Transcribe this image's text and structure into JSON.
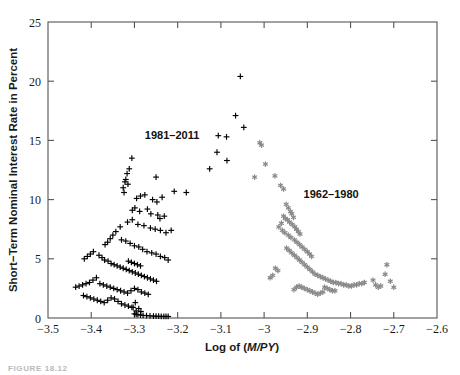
{
  "figure": {
    "caption": "FIGURE 18.12"
  },
  "chart_data": {
    "type": "scatter",
    "title": "",
    "xlabel_prefix": "Log of (",
    "xlabel_italic": "M/PY",
    "xlabel_suffix": ")",
    "xlabel": "Log of (M/PY)",
    "ylabel": "Short−Term Nominal Interest Rate in Percent",
    "xlim": [
      -3.5,
      -2.6
    ],
    "ylim": [
      0,
      25
    ],
    "xticks": [
      -3.5,
      -3.4,
      -3.3,
      -3.2,
      -3.1,
      -3.0,
      -2.9,
      -2.8,
      -2.7,
      -2.6
    ],
    "xticklabels": [
      "−3.5",
      "−3.4",
      "−3.3",
      "−3.2",
      "−3.1",
      "−3",
      "−2.9",
      "−2.8",
      "−2.7",
      "−2.6"
    ],
    "yticks": [
      0,
      5,
      10,
      15,
      20,
      25
    ],
    "yticklabels": [
      "0",
      "5",
      "10",
      "15",
      "20",
      "25"
    ],
    "grid": false,
    "legend_position": "inline-annotations",
    "series": [
      {
        "name": "1981–2011",
        "marker": "plus",
        "color": "#000000",
        "annotation": {
          "text": "1981–2011",
          "x": -3.213,
          "y": 15.1
        },
        "points": [
          [
            -3.055,
            20.4
          ],
          [
            -3.066,
            17.1
          ],
          [
            -3.047,
            16.1
          ],
          [
            -3.106,
            15.4
          ],
          [
            -3.087,
            15.3
          ],
          [
            -3.109,
            14.0
          ],
          [
            -3.086,
            13.3
          ],
          [
            -3.126,
            12.6
          ],
          [
            -3.306,
            13.5
          ],
          [
            -3.312,
            12.6
          ],
          [
            -3.317,
            12.2
          ],
          [
            -3.32,
            11.7
          ],
          [
            -3.322,
            11.5
          ],
          [
            -3.315,
            11.3
          ],
          [
            -3.326,
            11.0
          ],
          [
            -3.324,
            10.6
          ],
          [
            -3.25,
            11.9
          ],
          [
            -3.208,
            10.7
          ],
          [
            -3.18,
            10.6
          ],
          [
            -3.276,
            10.4
          ],
          [
            -3.286,
            10.3
          ],
          [
            -3.295,
            10.1
          ],
          [
            -3.258,
            10.0
          ],
          [
            -3.248,
            9.8
          ],
          [
            -3.236,
            10.2
          ],
          [
            -3.299,
            9.3
          ],
          [
            -3.305,
            9.1
          ],
          [
            -3.288,
            9.0
          ],
          [
            -3.27,
            9.2
          ],
          [
            -3.262,
            8.8
          ],
          [
            -3.246,
            8.7
          ],
          [
            -3.241,
            8.4
          ],
          [
            -3.231,
            8.6
          ],
          [
            -3.305,
            8.3
          ],
          [
            -3.316,
            8.1
          ],
          [
            -3.292,
            7.9
          ],
          [
            -3.278,
            7.8
          ],
          [
            -3.263,
            7.6
          ],
          [
            -3.252,
            7.5
          ],
          [
            -3.24,
            7.4
          ],
          [
            -3.227,
            7.2
          ],
          [
            -3.215,
            7.4
          ],
          [
            -3.333,
            7.7
          ],
          [
            -3.343,
            7.3
          ],
          [
            -3.35,
            7.0
          ],
          [
            -3.356,
            6.7
          ],
          [
            -3.362,
            6.4
          ],
          [
            -3.368,
            6.2
          ],
          [
            -3.33,
            6.6
          ],
          [
            -3.32,
            6.5
          ],
          [
            -3.31,
            6.3
          ],
          [
            -3.3,
            6.1
          ],
          [
            -3.29,
            6.0
          ],
          [
            -3.281,
            5.8
          ],
          [
            -3.271,
            5.6
          ],
          [
            -3.26,
            5.5
          ],
          [
            -3.25,
            5.4
          ],
          [
            -3.24,
            5.2
          ],
          [
            -3.23,
            5.1
          ],
          [
            -3.222,
            4.9
          ],
          [
            -3.395,
            5.6
          ],
          [
            -3.402,
            5.4
          ],
          [
            -3.409,
            5.2
          ],
          [
            -3.416,
            5.0
          ],
          [
            -3.382,
            5.3
          ],
          [
            -3.375,
            5.1
          ],
          [
            -3.369,
            4.9
          ],
          [
            -3.361,
            4.8
          ],
          [
            -3.354,
            4.6
          ],
          [
            -3.347,
            4.5
          ],
          [
            -3.34,
            4.4
          ],
          [
            -3.333,
            4.3
          ],
          [
            -3.326,
            4.2
          ],
          [
            -3.319,
            4.1
          ],
          [
            -3.312,
            4.0
          ],
          [
            -3.305,
            3.9
          ],
          [
            -3.298,
            3.8
          ],
          [
            -3.291,
            3.7
          ],
          [
            -3.284,
            3.6
          ],
          [
            -3.277,
            3.5
          ],
          [
            -3.27,
            3.4
          ],
          [
            -3.263,
            3.3
          ],
          [
            -3.256,
            3.2
          ],
          [
            -3.249,
            3.1
          ],
          [
            -3.3,
            4.6
          ],
          [
            -3.293,
            4.5
          ],
          [
            -3.286,
            4.4
          ],
          [
            -3.307,
            4.7
          ],
          [
            -3.314,
            4.8
          ],
          [
            -3.388,
            3.4
          ],
          [
            -3.396,
            3.2
          ],
          [
            -3.404,
            3.0
          ],
          [
            -3.412,
            2.9
          ],
          [
            -3.42,
            2.8
          ],
          [
            -3.428,
            2.7
          ],
          [
            -3.436,
            2.6
          ],
          [
            -3.38,
            2.9
          ],
          [
            -3.372,
            2.8
          ],
          [
            -3.364,
            2.7
          ],
          [
            -3.356,
            2.6
          ],
          [
            -3.348,
            2.5
          ],
          [
            -3.34,
            2.4
          ],
          [
            -3.332,
            2.3
          ],
          [
            -3.324,
            2.2
          ],
          [
            -3.316,
            2.1
          ],
          [
            -3.308,
            2.3
          ],
          [
            -3.3,
            2.5
          ],
          [
            -3.292,
            2.4
          ],
          [
            -3.284,
            2.2
          ],
          [
            -3.276,
            2.1
          ],
          [
            -3.268,
            2.0
          ],
          [
            -3.418,
            1.9
          ],
          [
            -3.41,
            1.8
          ],
          [
            -3.402,
            1.7
          ],
          [
            -3.394,
            1.6
          ],
          [
            -3.386,
            1.5
          ],
          [
            -3.378,
            1.4
          ],
          [
            -3.37,
            1.3
          ],
          [
            -3.362,
            1.5
          ],
          [
            -3.354,
            1.7
          ],
          [
            -3.346,
            1.6
          ],
          [
            -3.338,
            1.4
          ],
          [
            -3.33,
            1.2
          ],
          [
            -3.322,
            1.1
          ],
          [
            -3.314,
            1.0
          ],
          [
            -3.306,
            0.9
          ],
          [
            -3.298,
            1.3
          ],
          [
            -3.29,
            0.8
          ],
          [
            -3.3,
            0.35
          ],
          [
            -3.296,
            0.3
          ],
          [
            -3.292,
            0.28
          ],
          [
            -3.286,
            0.25
          ],
          [
            -3.28,
            0.22
          ],
          [
            -3.272,
            0.2
          ],
          [
            -3.264,
            0.18
          ],
          [
            -3.256,
            0.16
          ],
          [
            -3.25,
            0.15
          ],
          [
            -3.244,
            0.15
          ],
          [
            -3.238,
            0.14
          ],
          [
            -3.232,
            0.14
          ],
          [
            -3.227,
            0.13
          ],
          [
            -3.222,
            0.13
          ],
          [
            -3.303,
            0.9
          ],
          [
            -3.296,
            0.6
          ],
          [
            -3.285,
            0.55
          ]
        ]
      },
      {
        "name": "1962–1980",
        "marker": "asterisk",
        "color": "#8a8a8a",
        "annotation": {
          "text": "1962–1980",
          "x": -2.845,
          "y": 10.1
        },
        "points": [
          [
            -3.01,
            14.8
          ],
          [
            -3.006,
            14.6
          ],
          [
            -2.997,
            13.0
          ],
          [
            -3.022,
            11.9
          ],
          [
            -2.975,
            12.0
          ],
          [
            -2.962,
            11.2
          ],
          [
            -2.955,
            10.9
          ],
          [
            -2.949,
            9.6
          ],
          [
            -2.944,
            9.3
          ],
          [
            -2.939,
            9.0
          ],
          [
            -2.936,
            8.8
          ],
          [
            -2.932,
            8.5
          ],
          [
            -2.946,
            8.3
          ],
          [
            -2.941,
            8.1
          ],
          [
            -2.935,
            7.9
          ],
          [
            -2.929,
            7.7
          ],
          [
            -2.925,
            7.5
          ],
          [
            -2.921,
            7.3
          ],
          [
            -2.917,
            7.1
          ],
          [
            -2.955,
            8.6
          ],
          [
            -2.951,
            8.4
          ],
          [
            -2.96,
            8.0
          ],
          [
            -2.966,
            7.7
          ],
          [
            -2.958,
            7.4
          ],
          [
            -2.952,
            7.2
          ],
          [
            -2.944,
            7.0
          ],
          [
            -2.938,
            6.8
          ],
          [
            -2.93,
            6.6
          ],
          [
            -2.924,
            6.4
          ],
          [
            -2.918,
            6.2
          ],
          [
            -2.912,
            6.0
          ],
          [
            -2.906,
            5.8
          ],
          [
            -2.9,
            5.6
          ],
          [
            -2.895,
            5.4
          ],
          [
            -2.89,
            5.2
          ],
          [
            -2.948,
            5.9
          ],
          [
            -2.942,
            5.7
          ],
          [
            -2.936,
            5.5
          ],
          [
            -2.93,
            5.3
          ],
          [
            -2.924,
            5.1
          ],
          [
            -2.918,
            4.9
          ],
          [
            -2.912,
            4.7
          ],
          [
            -2.906,
            4.5
          ],
          [
            -2.9,
            4.3
          ],
          [
            -2.894,
            4.1
          ],
          [
            -2.888,
            3.9
          ],
          [
            -2.882,
            3.7
          ],
          [
            -2.876,
            3.6
          ],
          [
            -2.87,
            3.5
          ],
          [
            -2.864,
            3.4
          ],
          [
            -2.858,
            3.3
          ],
          [
            -2.852,
            3.2
          ],
          [
            -2.846,
            3.1
          ],
          [
            -2.84,
            3.0
          ],
          [
            -2.834,
            3.0
          ],
          [
            -2.828,
            2.9
          ],
          [
            -2.822,
            2.9
          ],
          [
            -2.816,
            2.8
          ],
          [
            -2.81,
            2.8
          ],
          [
            -2.804,
            2.7
          ],
          [
            -2.798,
            2.7
          ],
          [
            -2.792,
            2.8
          ],
          [
            -2.786,
            2.8
          ],
          [
            -2.78,
            2.9
          ],
          [
            -2.774,
            2.9
          ],
          [
            -2.768,
            3.0
          ],
          [
            -2.9,
            2.4
          ],
          [
            -2.894,
            2.3
          ],
          [
            -2.888,
            2.2
          ],
          [
            -2.882,
            2.1
          ],
          [
            -2.876,
            2.0
          ],
          [
            -2.87,
            2.1
          ],
          [
            -2.864,
            2.2
          ],
          [
            -2.913,
            2.6
          ],
          [
            -2.907,
            2.5
          ],
          [
            -2.919,
            2.7
          ],
          [
            -2.925,
            2.6
          ],
          [
            -2.931,
            2.4
          ],
          [
            -2.86,
            2.6
          ],
          [
            -2.854,
            2.5
          ],
          [
            -2.848,
            2.4
          ],
          [
            -2.842,
            2.3
          ],
          [
            -2.836,
            2.3
          ],
          [
            -2.72,
            3.7
          ],
          [
            -2.716,
            4.5
          ],
          [
            -2.708,
            3.1
          ],
          [
            -2.7,
            2.6
          ],
          [
            -2.748,
            3.2
          ],
          [
            -2.742,
            2.8
          ],
          [
            -2.736,
            2.6
          ],
          [
            -2.73,
            2.7
          ],
          [
            -2.968,
            4.0
          ],
          [
            -2.974,
            4.2
          ],
          [
            -2.98,
            3.6
          ],
          [
            -2.986,
            3.4
          ]
        ]
      }
    ]
  }
}
